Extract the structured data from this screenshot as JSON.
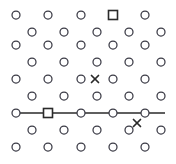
{
  "figure": {
    "title": "",
    "width": 176,
    "height": 164,
    "background": "#ffffff",
    "marker_stroke": "#3b3b46",
    "line_color": "#2a2a2a"
  },
  "chart_data": {
    "type": "scatter",
    "title": "",
    "subtitle": "",
    "xlabel": "",
    "ylabel": "",
    "xlim": [
      0,
      176
    ],
    "ylim": [
      0,
      164
    ],
    "grid": false,
    "legend": null,
    "axes_visible": false,
    "tick_labels": {
      "x": [],
      "y": []
    },
    "lattice": {
      "rows": 9,
      "markers_per_row": 5,
      "row_y": [
        15,
        32,
        45,
        62,
        79,
        96,
        113,
        130,
        147
      ],
      "odd_row_x": [
        16,
        48,
        81,
        113,
        145
      ],
      "even_row_x": [
        32,
        64,
        97,
        129,
        161
      ],
      "row_parity": [
        "odd",
        "even",
        "odd",
        "even",
        "odd",
        "even",
        "odd",
        "even",
        "odd"
      ]
    },
    "series": [
      {
        "name": "circle-markers",
        "marker": "circle-open",
        "size": 8,
        "color": "#3b3b46",
        "points": [
          [
            16,
            15
          ],
          [
            48,
            15
          ],
          [
            81,
            15
          ],
          [
            145,
            15
          ],
          [
            32,
            32
          ],
          [
            64,
            32
          ],
          [
            97,
            32
          ],
          [
            129,
            32
          ],
          [
            161,
            32
          ],
          [
            16,
            45
          ],
          [
            48,
            45
          ],
          [
            81,
            45
          ],
          [
            113,
            45
          ],
          [
            145,
            45
          ],
          [
            32,
            62
          ],
          [
            64,
            62
          ],
          [
            97,
            62
          ],
          [
            129,
            62
          ],
          [
            161,
            62
          ],
          [
            16,
            79
          ],
          [
            48,
            79
          ],
          [
            81,
            79
          ],
          [
            113,
            79
          ],
          [
            145,
            79
          ],
          [
            32,
            96
          ],
          [
            64,
            96
          ],
          [
            97,
            96
          ],
          [
            129,
            96
          ],
          [
            161,
            96
          ],
          [
            16,
            113
          ],
          [
            81,
            113
          ],
          [
            113,
            113
          ],
          [
            145,
            113
          ],
          [
            32,
            130
          ],
          [
            64,
            130
          ],
          [
            97,
            130
          ],
          [
            129,
            130
          ],
          [
            161,
            130
          ],
          [
            16,
            147
          ],
          [
            48,
            147
          ],
          [
            81,
            147
          ],
          [
            113,
            147
          ],
          [
            145,
            147
          ]
        ]
      },
      {
        "name": "square-markers",
        "marker": "square-open",
        "size": 9,
        "color": "#2a2a2a",
        "points": [
          [
            113,
            15
          ],
          [
            48,
            113
          ]
        ]
      },
      {
        "name": "x-markers",
        "marker": "x",
        "size": 7,
        "color": "#2a2a2a",
        "points": [
          [
            95,
            79
          ],
          [
            137,
            123
          ]
        ]
      }
    ],
    "lines": [
      {
        "name": "horizontal-path",
        "color": "#2a2a2a",
        "width": 1.3,
        "points": [
          [
            13,
            113
          ],
          [
            165,
            113
          ]
        ]
      }
    ]
  }
}
